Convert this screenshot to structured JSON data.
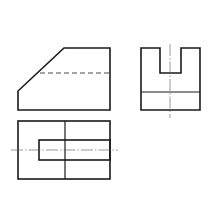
{
  "drawing": {
    "type": "orthographic-three-view",
    "colors": {
      "line": "#1a1a1a",
      "background": "#ffffff",
      "centerline": "#555555"
    },
    "views": {
      "front": {
        "outline": [
          [
            64,
            48
          ],
          [
            110,
            48
          ],
          [
            110,
            110
          ],
          [
            18,
            110
          ],
          [
            18,
            91
          ]
        ],
        "hidden_line": {
          "x1": 40,
          "y1": 73,
          "x2": 110,
          "y2": 73
        }
      },
      "side": {
        "outline": [
          [
            141,
            48
          ],
          [
            160,
            48
          ],
          [
            160,
            73
          ],
          [
            181,
            73
          ],
          [
            181,
            48
          ],
          [
            200,
            48
          ],
          [
            200,
            110
          ],
          [
            141,
            110
          ]
        ],
        "inner_line": {
          "x1": 141,
          "y1": 92,
          "x2": 200,
          "y2": 92
        },
        "centerline": {
          "x1": 170,
          "y1": 44,
          "x2": 170,
          "y2": 118
        }
      },
      "top": {
        "outer_rect": {
          "x": 18,
          "y": 121,
          "w": 92,
          "h": 58
        },
        "divider": {
          "x1": 65,
          "y1": 121,
          "x2": 65,
          "y2": 179
        },
        "inner_rect": {
          "x": 39,
          "y": 140,
          "w": 71,
          "h": 20
        },
        "centerline": {
          "x1": 11,
          "y1": 150,
          "x2": 118,
          "y2": 150
        }
      }
    }
  }
}
